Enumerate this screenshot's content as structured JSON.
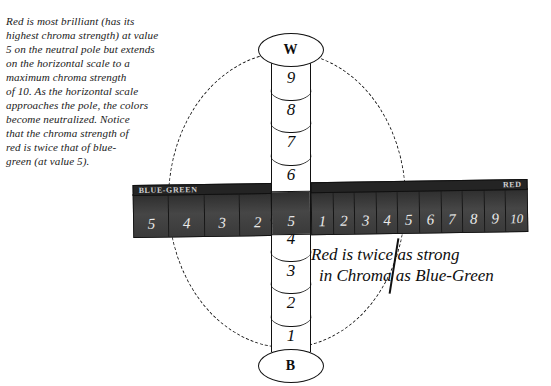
{
  "explanation": {
    "lines": [
      "Red is most brilliant (has its",
      "highest chroma strength) at value",
      "5 on the neutral pole but extends",
      "on the horizontal scale to a",
      "maximum chroma strength",
      "of 10. As the horizontal scale",
      "approaches the pole, the colors",
      "become neutralized. Notice",
      "that the chroma strength of",
      "red is twice that of blue-",
      "green (at value 5)."
    ]
  },
  "pole": {
    "top_cap_label": "W",
    "bottom_cap_label": "B",
    "upper_values": [
      "9",
      "8",
      "7",
      "6"
    ],
    "lower_values": [
      "4",
      "3",
      "2",
      "1"
    ]
  },
  "band": {
    "left_ribbon_label": "BLUE-GREEN",
    "right_ribbon_label": "RED",
    "left_values": [
      "5",
      "4",
      "3",
      "2",
      "1"
    ],
    "center_value": "5",
    "right_values": [
      "1",
      "2",
      "3",
      "4",
      "5",
      "6",
      "7",
      "8",
      "9",
      "10"
    ]
  },
  "caption": {
    "line1": "Red is twice as strong",
    "line2": "in Chroma as Blue-Green"
  },
  "chart_data": {
    "type": "diagram",
    "vertical_axis": {
      "name": "Value (neutral pole)",
      "top_pole": "W",
      "bottom_pole": "B",
      "ticks": [
        "9",
        "8",
        "7",
        "6",
        "5",
        "4",
        "3",
        "2",
        "1"
      ],
      "range": [
        1,
        9
      ],
      "neutral_value_at_band": 5
    },
    "horizontal_axis": {
      "name": "Chroma",
      "left_hue": "BLUE-GREEN",
      "right_hue": "RED",
      "left_ticks": [
        "5",
        "4",
        "3",
        "2",
        "1"
      ],
      "center_tick": "5",
      "right_ticks": [
        "1",
        "2",
        "3",
        "4",
        "5",
        "6",
        "7",
        "8",
        "9",
        "10"
      ]
    },
    "series": [
      {
        "name": "RED",
        "max_chroma": 10,
        "at_value": 5
      },
      {
        "name": "BLUE-GREEN",
        "max_chroma": 5,
        "at_value": 5
      }
    ],
    "annotations": [
      "Red is twice as strong in Chroma as Blue-Green"
    ]
  }
}
